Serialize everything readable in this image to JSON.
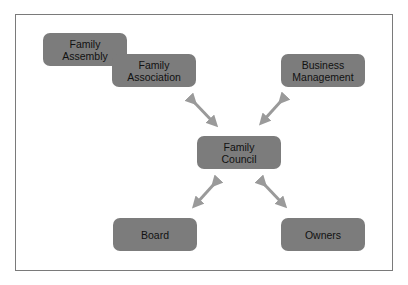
{
  "diagram": {
    "nodes": [
      {
        "id": "family-assembly",
        "label": "Family\nAssembly",
        "x": 43,
        "y": 33
      },
      {
        "id": "family-association",
        "label": "Family\nAssociation",
        "x": 112,
        "y": 54
      },
      {
        "id": "business-management",
        "label": "Business\nManagement",
        "x": 281,
        "y": 54
      },
      {
        "id": "family-council",
        "label": "Family\nCouncil",
        "x": 197,
        "y": 136
      },
      {
        "id": "board",
        "label": "Board",
        "x": 113,
        "y": 218
      },
      {
        "id": "owners",
        "label": "Owners",
        "x": 281,
        "y": 218
      }
    ],
    "edges": [
      {
        "from": "family-association",
        "to": "family-council",
        "type": "bidirectional"
      },
      {
        "from": "business-management",
        "to": "family-council",
        "type": "bidirectional"
      },
      {
        "from": "board",
        "to": "family-council",
        "type": "bidirectional"
      },
      {
        "from": "owners",
        "to": "family-council",
        "type": "bidirectional"
      }
    ],
    "colors": {
      "node_fill": "#7c7c7c",
      "arrow": "#9a9a9a",
      "frame_border": "#7a7a7a"
    }
  }
}
